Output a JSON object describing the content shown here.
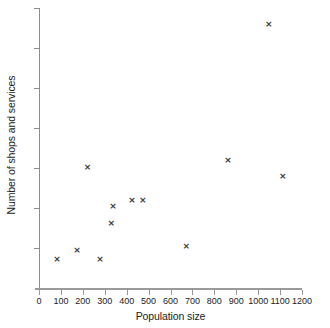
{
  "chart_data": {
    "type": "scatter",
    "title": "",
    "xlabel": "Population size",
    "ylabel": "Number of shops and services",
    "xlim": [
      0,
      1200
    ],
    "ylim": [
      0,
      35
    ],
    "grid": false,
    "legend": false,
    "marker": "x",
    "marker_color": "#3a3a3a",
    "axis_color": "#9a9a9a",
    "xticks": [
      0,
      100,
      200,
      300,
      400,
      500,
      600,
      700,
      800,
      900,
      1000,
      1100,
      1200
    ],
    "xtick_labels": [
      "0",
      "100",
      "200",
      "300",
      "400",
      "500",
      "600",
      "700",
      "800",
      "900",
      "1000",
      "1100",
      "1200"
    ],
    "yticks": [
      5,
      10,
      15,
      20,
      25,
      30,
      35
    ],
    "ytick_labels": [
      "5",
      "10",
      "15",
      "20",
      "25",
      "30",
      "35"
    ],
    "points": [
      {
        "x": 82,
        "y": 3.6
      },
      {
        "x": 174,
        "y": 4.7
      },
      {
        "x": 222,
        "y": 15.1
      },
      {
        "x": 278,
        "y": 3.6
      },
      {
        "x": 330,
        "y": 8.1
      },
      {
        "x": 338,
        "y": 10.2
      },
      {
        "x": 424,
        "y": 11.0
      },
      {
        "x": 474,
        "y": 11.0
      },
      {
        "x": 672,
        "y": 5.2
      },
      {
        "x": 862,
        "y": 16.0
      },
      {
        "x": 1048,
        "y": 33.0
      },
      {
        "x": 1112,
        "y": 14.0
      }
    ]
  }
}
